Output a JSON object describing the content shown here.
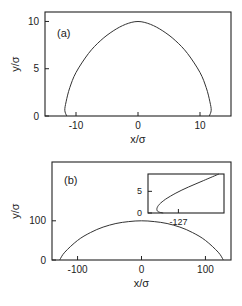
{
  "chart_data": [
    {
      "type": "line",
      "panel_label": "(a)",
      "xlabel": "x/σ",
      "ylabel": "y/σ",
      "xlim": [
        -15,
        15
      ],
      "ylim": [
        0,
        11
      ],
      "xticks": [
        -10,
        0,
        10
      ],
      "xtick_labels": [
        "-10",
        "0",
        "10"
      ],
      "yticks": [
        0,
        5,
        10
      ],
      "ytick_labels": [
        "0",
        "5",
        "10"
      ],
      "grid": false,
      "series": [
        {
          "name": "profile",
          "x": [
            -11.5,
            -11.8,
            -11.6,
            -11.0,
            -10.0,
            -8.0,
            -6.0,
            -4.0,
            -2.0,
            0.0,
            2.0,
            4.0,
            6.0,
            8.0,
            10.0,
            11.0,
            11.6,
            11.8,
            11.5
          ],
          "y": [
            0.0,
            0.6,
            1.5,
            3.0,
            4.6,
            6.6,
            8.0,
            9.0,
            9.7,
            10.0,
            9.7,
            9.0,
            8.0,
            6.6,
            4.6,
            3.0,
            1.5,
            0.6,
            0.0
          ]
        }
      ]
    },
    {
      "type": "line",
      "panel_label": "(b)",
      "xlabel": "x/σ",
      "ylabel": "y/σ",
      "xlim": [
        -140,
        140
      ],
      "ylim": [
        0,
        250
      ],
      "xticks": [
        -100,
        0,
        100
      ],
      "xtick_labels": [
        "-100",
        "0",
        "100"
      ],
      "yticks": [
        0,
        100
      ],
      "ytick_labels": [
        "0",
        "100"
      ],
      "grid": false,
      "series": [
        {
          "name": "profile",
          "x": [
            -128,
            -120,
            -100,
            -80,
            -60,
            -40,
            -20,
            0,
            20,
            40,
            60,
            80,
            100,
            120,
            128
          ],
          "y": [
            0,
            20,
            50,
            70,
            84,
            93,
            98,
            100,
            98,
            93,
            84,
            70,
            50,
            20,
            0
          ]
        }
      ],
      "inset": {
        "type": "line",
        "xticks": [
          -127
        ],
        "xtick_labels": [
          "-127"
        ],
        "yticks": [
          0,
          5
        ],
        "ytick_labels": [
          "0",
          "5"
        ],
        "xlim": [
          -128.2,
          -125.2
        ],
        "ylim": [
          0,
          9
        ],
        "series": [
          {
            "name": "contact-line-detail",
            "x": [
              -127.6,
              -127.8,
              -127.85,
              -127.75,
              -127.5,
              -127.1,
              -126.6,
              -126.0,
              -125.4
            ],
            "y": [
              0.0,
              0.3,
              1.0,
              2.0,
              3.2,
              4.6,
              6.0,
              7.5,
              9.0
            ]
          }
        ]
      }
    }
  ]
}
